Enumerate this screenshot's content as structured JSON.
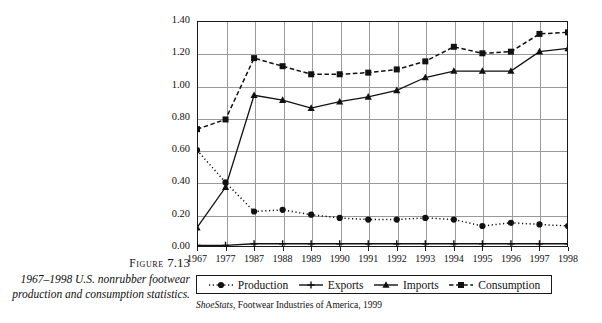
{
  "figure": {
    "label_prefix": "Figure",
    "label_number": "7.13",
    "caption": "1967–1998 U.S. nonrubber footwear production and consumption statistics."
  },
  "source": {
    "title": "ShoeStats",
    "rest": ", Footwear Industries of America, 1999"
  },
  "legend": {
    "position": "bottom",
    "items": [
      {
        "label": "Production",
        "marker": "circle",
        "line": "dotted",
        "color": "#111111"
      },
      {
        "label": "Exports",
        "marker": "plus",
        "line": "solid",
        "color": "#111111"
      },
      {
        "label": "Imports",
        "marker": "triangle",
        "line": "solid",
        "color": "#111111"
      },
      {
        "label": "Consumption",
        "marker": "square",
        "line": "dashed",
        "color": "#111111"
      }
    ]
  },
  "chart_data": {
    "type": "line",
    "title": "",
    "xlabel": "",
    "ylabel": "Billions of Pairs",
    "categories": [
      "1967",
      "1977",
      "1987",
      "1988",
      "1989",
      "1990",
      "1991",
      "1992",
      "1993",
      "1994",
      "1995",
      "1996",
      "1997",
      "1998"
    ],
    "ylim": [
      0.0,
      1.4
    ],
    "ytick_labels": [
      "0.00",
      "0.20",
      "0.40",
      "0.60",
      "0.80",
      "1.00",
      "1.20",
      "1.40"
    ],
    "ytick_values": [
      0.0,
      0.2,
      0.4,
      0.6,
      0.8,
      1.0,
      1.2,
      1.4
    ],
    "grid": true,
    "series": [
      {
        "name": "Production",
        "marker": "circle",
        "line": "dotted",
        "values": [
          0.6,
          0.4,
          0.22,
          0.23,
          0.2,
          0.18,
          0.17,
          0.17,
          0.18,
          0.17,
          0.13,
          0.15,
          0.14,
          0.13
        ]
      },
      {
        "name": "Exports",
        "marker": "plus",
        "line": "solid",
        "values": [
          0.01,
          0.01,
          0.02,
          0.02,
          0.02,
          0.02,
          0.02,
          0.02,
          0.02,
          0.02,
          0.02,
          0.02,
          0.02,
          0.02
        ]
      },
      {
        "name": "Imports",
        "marker": "triangle",
        "line": "solid",
        "values": [
          0.12,
          0.37,
          0.94,
          0.91,
          0.86,
          0.9,
          0.93,
          0.97,
          1.05,
          1.09,
          1.09,
          1.09,
          1.21,
          1.23
        ]
      },
      {
        "name": "Consumption",
        "marker": "square",
        "line": "dashed",
        "values": [
          0.73,
          0.79,
          1.17,
          1.12,
          1.07,
          1.07,
          1.08,
          1.1,
          1.15,
          1.24,
          1.2,
          1.21,
          1.32,
          1.33
        ]
      }
    ]
  }
}
